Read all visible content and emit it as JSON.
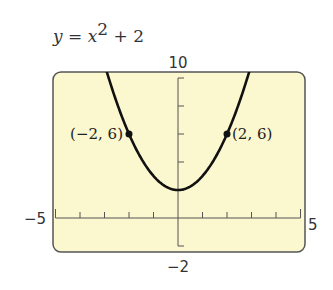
{
  "chart_data": {
    "type": "line",
    "equation": {
      "lhs": "y",
      "eq": " = ",
      "var": "x",
      "exp": "2",
      "rest": " + 2"
    },
    "xlabel": "",
    "ylabel": "",
    "xlim": [
      -5,
      5
    ],
    "ylim": [
      -2,
      10
    ],
    "x_window_labels": {
      "min": "−5",
      "max": "5"
    },
    "y_window_labels": {
      "min": "−2",
      "max": "10"
    },
    "xtick_step": 1,
    "ytick_step": 2,
    "grid": false,
    "series": [
      {
        "name": "y = x^2 + 2",
        "function": "x^2 + 2",
        "color": "#111111",
        "x": [
          -3.2,
          -3,
          -2,
          -1,
          0,
          1,
          2,
          3,
          3.2
        ],
        "y": [
          12.24,
          11,
          6,
          3,
          2,
          3,
          6,
          11,
          12.24
        ]
      }
    ],
    "annotations": [
      {
        "label": "(−2, 6)",
        "x": -2,
        "y": 6
      },
      {
        "label": "(2, 6)",
        "x": 2,
        "y": 6
      }
    ],
    "background_color": "#fbf7cf",
    "frame_color": "#555555"
  }
}
